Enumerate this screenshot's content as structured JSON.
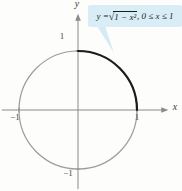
{
  "figure": {
    "formula": {
      "lhs": "y = ",
      "sqrt": "√",
      "radicand": "1 − x²",
      "constraint": ", 0 ≤ x ≤ 1"
    }
  },
  "colors": {
    "background": "#fdfdfb",
    "callout_bg": "#d9edf6",
    "callout_tail": "#cde6f2",
    "circle_gray": "#9b9b9b",
    "arc_black": "#1c1c1c",
    "axis_gray": "#8a8a8a",
    "tick_gray": "#6e6e6e",
    "label_color": "#4a4a4a"
  },
  "chart_data": {
    "type": "line",
    "title": "",
    "annotation": "y = √(1 − x²), 0 ≤ x ≤ 1",
    "xlabel": "x",
    "ylabel": "y",
    "xlim": [
      -1.29,
      1.53
    ],
    "ylim": [
      -1.34,
      1.63
    ],
    "grid": false,
    "legend": null,
    "xticks": [
      {
        "value": -1,
        "label": "−1"
      },
      {
        "value": 1,
        "label": "1"
      }
    ],
    "yticks": [
      {
        "value": -1,
        "label": "−1"
      },
      {
        "value": 1,
        "label": "1"
      }
    ],
    "series": [
      {
        "name": "unit-circle",
        "equation": "x² + y² = 1",
        "shape": "circle",
        "center": [
          0,
          0
        ],
        "radius": 1,
        "color": "#9b9b9b",
        "stroke_width": 1.2
      },
      {
        "name": "highlighted-arc",
        "equation": "y = √(1 − x²), 0 ≤ x ≤ 1",
        "shape": "arc",
        "center": [
          0,
          0
        ],
        "radius": 1,
        "from": [
          0,
          1
        ],
        "to": [
          1,
          0
        ],
        "color": "#1c1c1c",
        "stroke_width": 2.2,
        "points": [
          [
            0,
            1
          ],
          [
            0.259,
            0.966
          ],
          [
            0.5,
            0.866
          ],
          [
            0.707,
            0.707
          ],
          [
            0.866,
            0.5
          ],
          [
            0.966,
            0.259
          ],
          [
            1,
            0
          ]
        ]
      }
    ]
  }
}
